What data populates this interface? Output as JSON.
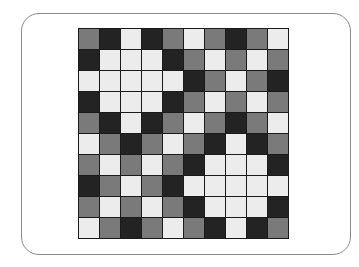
{
  "board": {
    "rows": 10,
    "cols": 10,
    "colors": {
      "D": "#232323",
      "M": "#7a7a7a",
      "L": "#ececec",
      "grid_line": "#1a1a1a"
    },
    "legend": {
      "D": "dark",
      "M": "mid-gray",
      "L": "light"
    },
    "cells": [
      [
        "M",
        "D",
        "L",
        "D",
        "M",
        "L",
        "M",
        "D",
        "M",
        "L"
      ],
      [
        "D",
        "L",
        "L",
        "L",
        "D",
        "M",
        "L",
        "M",
        "L",
        "M"
      ],
      [
        "L",
        "L",
        "L",
        "L",
        "L",
        "D",
        "M",
        "L",
        "M",
        "D"
      ],
      [
        "D",
        "L",
        "L",
        "L",
        "D",
        "M",
        "L",
        "M",
        "L",
        "M"
      ],
      [
        "M",
        "D",
        "L",
        "D",
        "M",
        "L",
        "M",
        "D",
        "M",
        "L"
      ],
      [
        "L",
        "M",
        "D",
        "M",
        "L",
        "M",
        "D",
        "L",
        "D",
        "M"
      ],
      [
        "M",
        "L",
        "M",
        "L",
        "M",
        "D",
        "L",
        "L",
        "L",
        "D"
      ],
      [
        "D",
        "M",
        "L",
        "M",
        "D",
        "L",
        "L",
        "L",
        "L",
        "L"
      ],
      [
        "M",
        "L",
        "M",
        "L",
        "M",
        "D",
        "L",
        "L",
        "L",
        "D"
      ],
      [
        "L",
        "M",
        "D",
        "M",
        "L",
        "M",
        "D",
        "L",
        "D",
        "M"
      ]
    ]
  }
}
